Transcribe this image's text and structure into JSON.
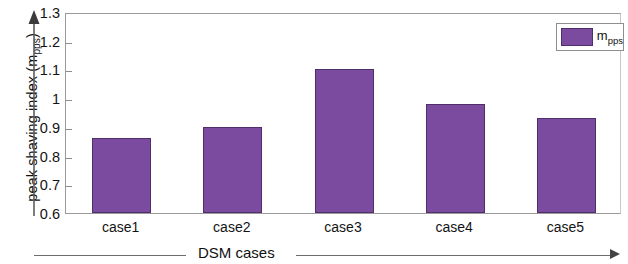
{
  "chart_data": {
    "type": "bar",
    "title": "",
    "categories": [
      "case1",
      "case2",
      "case3",
      "case4",
      "case5"
    ],
    "values": [
      0.86,
      0.9,
      1.1,
      0.98,
      0.93
    ],
    "series": [
      {
        "name": "m_pps",
        "values": [
          0.86,
          0.9,
          1.1,
          0.98,
          0.93
        ],
        "color": "#7a4b9e"
      }
    ],
    "xlabel": "DSM cases",
    "ylabel": "peak shaving index (m",
    "ylabel_sub": "pps",
    "ylabel_tail": ")",
    "ylim": [
      0.6,
      1.3
    ],
    "yticks": [
      "0.6",
      "0.7",
      "0.8",
      "0.9",
      "1",
      "1.1",
      "1.2",
      "1.3"
    ],
    "ytick_values": [
      0.6,
      0.7,
      0.8,
      0.9,
      1.0,
      1.1,
      1.2,
      1.3
    ],
    "grid": false,
    "legend_position": "top-right",
    "legend": [
      {
        "label_main": "m",
        "label_sub": "pps",
        "color": "#7a4b9e"
      }
    ],
    "bar_color": "#7a4b9e",
    "bar_edge_color": "#4e2f69",
    "axis_color": "#8d8d8d"
  }
}
